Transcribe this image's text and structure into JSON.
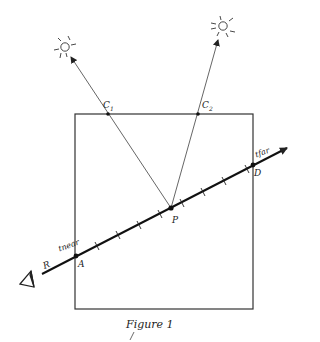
{
  "figure": {
    "caption": "Figure 1",
    "colors": {
      "stroke": "#222222",
      "thin": "#555555",
      "background": "#ffffff"
    },
    "box": {
      "x": 75,
      "y": 114,
      "width": 178,
      "height": 195
    },
    "ray": {
      "label": "R",
      "eye": {
        "x": 35,
        "y": 278
      },
      "end": {
        "x": 287,
        "y": 148
      },
      "tick_count": 8
    },
    "points": {
      "A": {
        "label": "A",
        "x": 76,
        "y": 256,
        "param_label": "tnear"
      },
      "D": {
        "label": "D",
        "x": 253,
        "y": 165,
        "param_label": "tfar"
      },
      "P": {
        "label": "P",
        "x": 171,
        "y": 208
      },
      "C1": {
        "label": "C",
        "sub": "1",
        "x": 108,
        "y": 114
      },
      "C2": {
        "label": "C",
        "sub": "2",
        "x": 198,
        "y": 114
      }
    },
    "lights": [
      {
        "name": "light-1",
        "x": 65,
        "y": 47,
        "arrow_tip": {
          "x": 71,
          "y": 57
        }
      },
      {
        "name": "light-2",
        "x": 223,
        "y": 26,
        "arrow_tip": {
          "x": 218,
          "y": 40
        }
      }
    ]
  }
}
